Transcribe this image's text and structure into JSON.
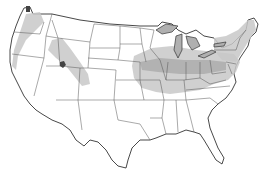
{
  "map": {
    "title": "",
    "region": "Contiguous United States",
    "colors": {
      "background": "#ffffff",
      "land": "#ffffff",
      "border": "#333333",
      "shade_light": "#c8c8c8",
      "shade_dark": "#a8a8a8",
      "lakes": "#b0b0b0"
    },
    "shaded_areas": [
      {
        "name": "pacific-northwest",
        "intensity": "light"
      },
      {
        "name": "great-basin-utah",
        "intensity": "light"
      },
      {
        "name": "midwest-ohio-valley",
        "intensity": "light"
      },
      {
        "name": "central-corridor",
        "intensity": "dark"
      },
      {
        "name": "northeast",
        "intensity": "light"
      }
    ],
    "legend": []
  }
}
